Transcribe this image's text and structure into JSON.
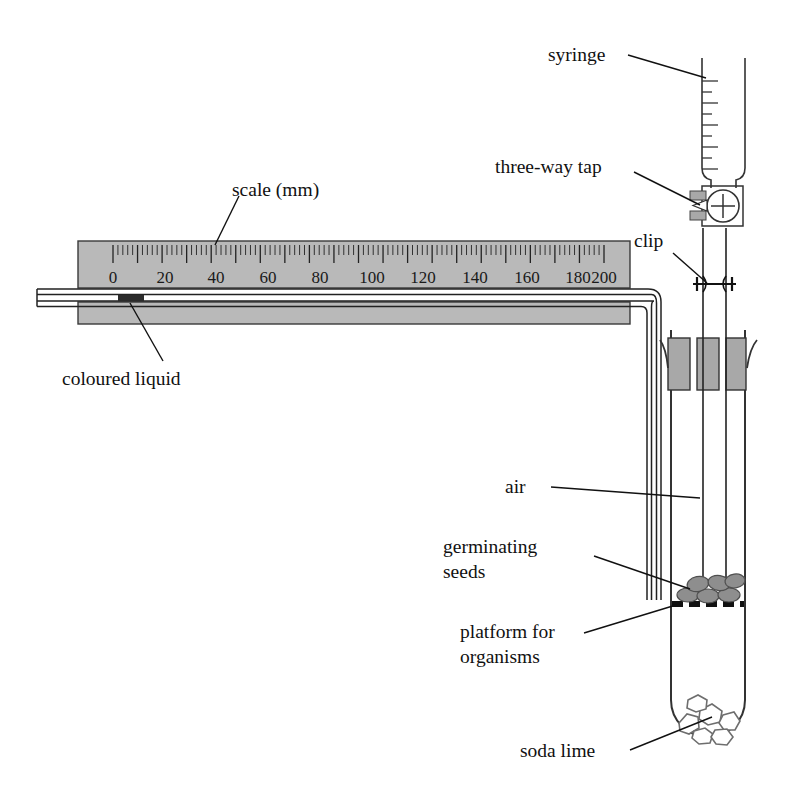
{
  "diagram": {
    "background_color": "#ffffff",
    "ink_color": "#111111",
    "ruler_fill": "#b9b9b9",
    "bung_fill": "#a8a8a8",
    "seed_fill": "#8e8e8e",
    "liquid_fill": "#2b2b2b",
    "glass_stroke": "#333333",
    "sodalime_fill": "#ffffff",
    "sodalime_stroke": "#6e6e6e"
  },
  "labels": {
    "syringe": "syringe",
    "three_way_tap": "three-way tap",
    "clip": "clip",
    "scale": "scale (mm)",
    "coloured_liquid": "coloured liquid",
    "air": "air",
    "germinating_seeds_line1": "germinating",
    "germinating_seeds_line2": "seeds",
    "platform_line1": "platform for",
    "platform_line2": "organisms",
    "soda_lime": "soda lime"
  },
  "scale": {
    "unit": "mm",
    "caption": "scale (mm)",
    "min": 0,
    "max": 200,
    "major_step": 20,
    "minor_step": 2,
    "tick_labels": [
      "0",
      "20",
      "40",
      "60",
      "80",
      "100",
      "120",
      "140",
      "160",
      "180",
      "200"
    ],
    "liquid_position_mm": 5
  },
  "syringe": {
    "graduation_count": 11
  },
  "components": [
    "syringe",
    "three-way tap",
    "clip",
    "capillary tube",
    "coloured liquid",
    "scale (mm)",
    "rubber bung",
    "air",
    "germinating seeds",
    "platform for organisms",
    "soda lime",
    "test tube"
  ]
}
